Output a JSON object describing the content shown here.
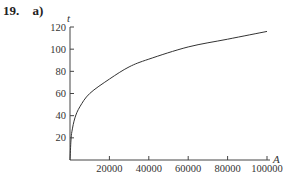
{
  "problem": {
    "number": "19.",
    "part": "a)"
  },
  "chart_data": {
    "type": "line",
    "title": "",
    "xlabel": "A",
    "ylabel": "t",
    "xlim": [
      0,
      100000
    ],
    "ylim": [
      0,
      120
    ],
    "grid": false,
    "legend": null,
    "x_ticks": [
      20000,
      40000,
      60000,
      80000,
      100000
    ],
    "x_tick_labels": [
      "20000",
      "40000",
      "60000",
      "80000",
      "100000"
    ],
    "y_ticks": [
      20,
      40,
      60,
      80,
      100,
      120
    ],
    "y_tick_labels": [
      "20",
      "40",
      "60",
      "80",
      "100",
      "120"
    ],
    "series": [
      {
        "name": "t(A)",
        "x": [
          0,
          500,
          1000,
          2500,
          5000,
          10000,
          20000,
          30000,
          40000,
          60000,
          80000,
          100000
        ],
        "values": [
          0,
          18,
          26,
          38,
          48,
          60,
          73,
          84,
          91,
          102,
          109,
          116
        ]
      }
    ],
    "line_color": "#333333"
  }
}
